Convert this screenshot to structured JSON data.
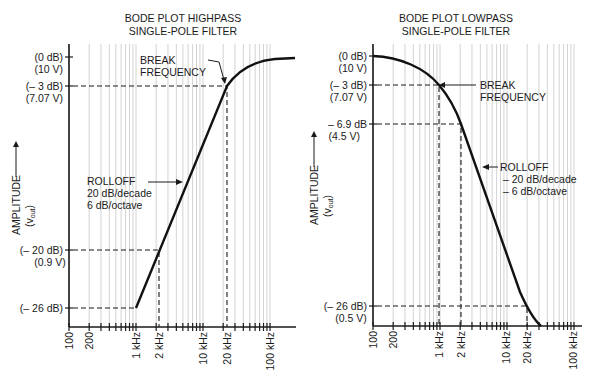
{
  "chart_data": [
    {
      "type": "line",
      "title": "BODE PLOT HIGHPASS SINGLE-POLE FILTER",
      "title_lines": [
        "BODE PLOT HIGHPASS",
        "SINGLE-POLE FILTER"
      ],
      "xlabel": "",
      "ylabel": "AMPLITUDE (v_out)",
      "ylabel_main": "AMPLITUDE",
      "ylabel_sub": "(v",
      "ylabel_subscript": "out",
      "x_scale": "log",
      "x_ticks": [
        "100",
        "200",
        "1 kHz",
        "2 kHz",
        "10 kHz",
        "20 kHz",
        "100 kHz"
      ],
      "y_ticks": [
        {
          "db": "(0 dB)",
          "volts": "(10 V)"
        },
        {
          "db": "(– 3 dB)",
          "volts": "(7.07 V)"
        },
        {
          "db": "(– 20 dB)",
          "volts": "(0.9 V)"
        },
        {
          "db": "(– 26 dB)",
          "volts": ""
        }
      ],
      "series": [
        {
          "name": "response",
          "x_hz": [
            1000,
            2000,
            20000,
            50000,
            150000
          ],
          "y_db": [
            -26,
            -20,
            -3,
            -1,
            0
          ]
        }
      ],
      "annotations": [
        {
          "text_lines": [
            "BREAK",
            "FREQUENCY"
          ],
          "points_to": "20 kHz, -3 dB"
        },
        {
          "text_lines": [
            "ROLLOFF",
            "20 dB/decade",
            "6 dB/octave"
          ]
        }
      ],
      "grid": true
    },
    {
      "type": "line",
      "title": "BODE PLOT LOWPASS SINGLE-POLE FILTER",
      "title_lines": [
        "BODE PLOT LOWPASS",
        "SINGLE-POLE FILTER"
      ],
      "xlabel": "",
      "ylabel": "AMPLITUDE (v_out)",
      "ylabel_main": "AMPLITUDE",
      "ylabel_sub": "(v",
      "ylabel_subscript": "out",
      "x_scale": "log",
      "x_ticks": [
        "100",
        "200",
        "1 kHz",
        "2 kHz",
        "10 kHz",
        "20 kHz",
        "100 kHz"
      ],
      "y_ticks": [
        {
          "db": "(0 dB)",
          "volts": "(10 V)"
        },
        {
          "db": "(– 3 dB)",
          "volts": "(7.07 V)"
        },
        {
          "db": "– 6.9 dB",
          "volts": "(4.5 V)"
        },
        {
          "db": "(– 26 dB)",
          "volts": "(0.5 V)"
        }
      ],
      "series": [
        {
          "name": "response",
          "x_hz": [
            100,
            1000,
            2000,
            20000,
            30000
          ],
          "y_db": [
            0,
            -3,
            -6.9,
            -26,
            -29
          ]
        }
      ],
      "annotations": [
        {
          "text_lines": [
            "BREAK",
            "FREQUENCY"
          ],
          "points_to": "1 kHz, -3 dB"
        },
        {
          "text_lines": [
            "ROLLOFF",
            "– 20 dB/decade",
            "– 6 dB/octave"
          ]
        }
      ],
      "grid": true
    }
  ]
}
